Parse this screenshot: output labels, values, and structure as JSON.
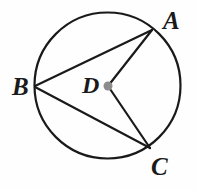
{
  "diagram": {
    "type": "geometry-circle",
    "background_color": "#fefefe",
    "stroke_color": "#1a1a1a",
    "center_dot_color": "#8c8c8c",
    "canvas": {
      "width": 197,
      "height": 190
    },
    "circle": {
      "center_x": 107.5,
      "center_y": 85.5,
      "radius": 73,
      "stroke_width": 2.2
    },
    "center_dot": {
      "x": 108,
      "y": 86,
      "radius": 4.5
    },
    "points": [
      {
        "id": "A",
        "label": "A",
        "x": 152,
        "y": 30,
        "on_circle": true
      },
      {
        "id": "B",
        "label": "B",
        "x": 35,
        "y": 86,
        "on_circle": true
      },
      {
        "id": "C",
        "label": "C",
        "x": 150,
        "y": 148,
        "on_circle": true
      },
      {
        "id": "D",
        "label": "D",
        "x": 108,
        "y": 86,
        "on_circle": false
      }
    ],
    "segments": [
      {
        "id": "BA",
        "from": "B",
        "to": "A",
        "kind": "chord",
        "x1": 35,
        "y1": 86,
        "x2": 152,
        "y2": 30
      },
      {
        "id": "BC",
        "from": "B",
        "to": "C",
        "kind": "chord",
        "x1": 35,
        "y1": 87,
        "x2": 150,
        "y2": 148
      },
      {
        "id": "DA",
        "from": "D",
        "to": "A",
        "kind": "radius",
        "x1": 108,
        "y1": 86,
        "x2": 152,
        "y2": 30
      },
      {
        "id": "DC",
        "from": "D",
        "to": "C",
        "kind": "radius",
        "x1": 108,
        "y1": 86,
        "x2": 150,
        "y2": 148
      }
    ],
    "labels": {
      "A": "A",
      "B": "B",
      "C": "C",
      "D": "D"
    }
  }
}
